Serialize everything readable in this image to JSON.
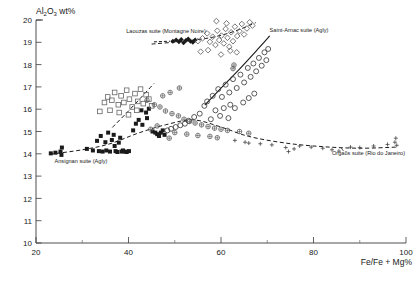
{
  "chart_data": {
    "type": "scatter",
    "title": "",
    "xlabel": "Fe/Fe + Mg%",
    "ylabel": "Al2O3 wt%",
    "ylabel_parts": {
      "pre": "Al",
      "sub1": "2",
      "mid": "O",
      "sub2": "3",
      "post": " wt%"
    },
    "xlim": [
      20,
      100
    ],
    "ylim": [
      10,
      20
    ],
    "xticks": [
      20,
      40,
      60,
      80,
      100
    ],
    "xticklabels": [
      "20",
      "40",
      "60",
      "80",
      "100"
    ],
    "xminorticks": [
      30,
      50,
      70,
      90
    ],
    "yticks": [
      10,
      11,
      12,
      13,
      14,
      15,
      16,
      17,
      18,
      19,
      20
    ],
    "yticklabels": [
      "10",
      "11",
      "12",
      "13",
      "14",
      "15",
      "16",
      "17",
      "18",
      "19",
      "20"
    ],
    "grid": false,
    "legend_position": "inline-annotations",
    "annotations": [
      {
        "name": "laouzas-label",
        "text": "Laouzas suite (Montagne Noire)",
        "x": 39.5,
        "y": 19.42,
        "anchor": "start"
      },
      {
        "name": "saint-arnac-label",
        "text": "Saint-Arnac suite (Agly)",
        "x": 70.5,
        "y": 19.45,
        "anchor": "start"
      },
      {
        "name": "ansignan-label",
        "text": "Ansignan suite (Agly)",
        "x": 24.0,
        "y": 13.6,
        "anchor": "start"
      },
      {
        "name": "orgaos-label",
        "text": "Orgaõs suite (Rio do Janeiro)",
        "x": 84.0,
        "y": 13.95,
        "anchor": "start"
      }
    ],
    "series": [
      {
        "name": "Ansignan suite (Agly)",
        "marker": "filled-square",
        "color": "#1a1a1a",
        "points": [
          [
            23.2,
            14.02
          ],
          [
            24.2,
            14.05
          ],
          [
            25.3,
            14.1
          ],
          [
            25.6,
            14.28
          ],
          [
            25.5,
            13.95
          ],
          [
            31.0,
            14.22
          ],
          [
            32.3,
            14.15
          ],
          [
            33.2,
            14.58
          ],
          [
            33.6,
            14.12
          ],
          [
            34.4,
            14.1
          ],
          [
            34.0,
            14.8
          ],
          [
            35.0,
            14.52
          ],
          [
            35.6,
            14.95
          ],
          [
            35.2,
            14.15
          ],
          [
            36.0,
            14.1
          ],
          [
            36.4,
            14.62
          ],
          [
            36.8,
            14.85
          ],
          [
            37.0,
            14.35
          ],
          [
            37.2,
            14.12
          ],
          [
            37.6,
            14.08
          ],
          [
            37.9,
            14.5
          ],
          [
            38.2,
            14.72
          ],
          [
            38.5,
            14.1
          ],
          [
            38.8,
            14.15
          ],
          [
            39.2,
            14.1
          ],
          [
            39.6,
            14.08
          ],
          [
            40.1,
            14.12
          ],
          [
            41.0,
            15.05
          ],
          [
            41.6,
            15.35
          ],
          [
            42.2,
            15.52
          ],
          [
            43.0,
            15.3
          ],
          [
            44.0,
            15.6
          ],
          [
            45.2,
            15.0
          ],
          [
            45.8,
            14.95
          ],
          [
            46.2,
            14.88
          ],
          [
            46.6,
            14.8
          ],
          [
            47.0,
            14.95
          ],
          [
            47.4,
            15.05
          ],
          [
            47.8,
            14.85
          ],
          [
            43.8,
            15.85
          ],
          [
            44.4,
            16.02
          ],
          [
            42.8,
            15.95
          ]
        ]
      },
      {
        "name": "Laouzas suite (Montagne Noire) - filled",
        "marker": "filled-diamond",
        "color": "#1a1a1a",
        "points": [
          [
            49.6,
            19.05
          ],
          [
            50.3,
            19.1
          ],
          [
            50.9,
            19.02
          ],
          [
            51.4,
            19.12
          ],
          [
            51.9,
            18.98
          ],
          [
            52.4,
            19.08
          ],
          [
            52.9,
            19.15
          ],
          [
            53.4,
            19.05
          ],
          [
            53.9,
            19.0
          ],
          [
            54.4,
            19.1
          ]
        ]
      },
      {
        "name": "Laouzas suite (Montagne Noire) - open",
        "marker": "open-diamond",
        "color": "#555555",
        "points": [
          [
            55.0,
            19.05
          ],
          [
            56.0,
            19.18
          ],
          [
            57.0,
            19.4
          ],
          [
            57.6,
            19.02
          ],
          [
            58.2,
            19.25
          ],
          [
            58.8,
            18.88
          ],
          [
            59.2,
            19.52
          ],
          [
            59.6,
            19.1
          ],
          [
            60.1,
            19.3
          ],
          [
            60.6,
            18.95
          ],
          [
            61.0,
            19.6
          ],
          [
            61.4,
            19.2
          ],
          [
            61.8,
            18.8
          ],
          [
            62.2,
            19.45
          ],
          [
            62.6,
            19.05
          ],
          [
            63.0,
            19.7
          ],
          [
            63.5,
            19.28
          ],
          [
            64.0,
            19.5
          ],
          [
            64.5,
            19.82
          ],
          [
            65.0,
            19.35
          ],
          [
            65.6,
            19.62
          ],
          [
            66.2,
            19.9
          ],
          [
            62.0,
            18.62
          ],
          [
            63.4,
            18.55
          ],
          [
            60.0,
            18.45
          ],
          [
            57.2,
            18.65
          ],
          [
            55.6,
            18.58
          ],
          [
            66.8,
            19.75
          ],
          [
            59.0,
            19.95
          ],
          [
            61.2,
            19.85
          ]
        ]
      },
      {
        "name": "Saint-Arnac suite (Agly)",
        "marker": "open-circle",
        "color": "#333333",
        "points": [
          [
            57.0,
            16.35
          ],
          [
            58.2,
            16.6
          ],
          [
            59.4,
            16.9
          ],
          [
            60.2,
            16.55
          ],
          [
            61.0,
            17.1
          ],
          [
            61.8,
            16.75
          ],
          [
            62.6,
            17.35
          ],
          [
            63.4,
            16.95
          ],
          [
            64.2,
            17.55
          ],
          [
            65.0,
            17.2
          ],
          [
            65.8,
            17.85
          ],
          [
            66.4,
            17.45
          ],
          [
            67.0,
            18.05
          ],
          [
            67.6,
            17.7
          ],
          [
            68.2,
            18.3
          ],
          [
            68.8,
            17.95
          ],
          [
            69.4,
            18.55
          ],
          [
            69.8,
            18.2
          ],
          [
            70.2,
            18.7
          ],
          [
            62.0,
            16.2
          ],
          [
            60.6,
            16.05
          ],
          [
            58.8,
            15.95
          ],
          [
            56.4,
            16.15
          ],
          [
            63.0,
            16.05
          ],
          [
            64.8,
            16.3
          ],
          [
            66.0,
            16.5
          ],
          [
            67.2,
            16.7
          ],
          [
            59.8,
            15.7
          ],
          [
            61.6,
            15.6
          ],
          [
            57.8,
            15.55
          ],
          [
            55.4,
            15.8
          ],
          [
            54.2,
            15.65
          ],
          [
            53.0,
            15.48
          ],
          [
            52.2,
            15.35
          ],
          [
            51.2,
            15.28
          ],
          [
            50.2,
            15.2
          ],
          [
            49.2,
            15.12
          ],
          [
            48.4,
            15.05
          ]
        ]
      },
      {
        "name": "Open squares cluster",
        "marker": "open-square",
        "color": "#666666",
        "points": [
          [
            35.5,
            16.55
          ],
          [
            36.4,
            16.4
          ],
          [
            37.0,
            16.75
          ],
          [
            37.8,
            16.2
          ],
          [
            38.4,
            16.6
          ],
          [
            39.0,
            16.3
          ],
          [
            39.6,
            16.85
          ],
          [
            40.2,
            16.45
          ],
          [
            40.8,
            16.1
          ],
          [
            41.4,
            16.7
          ],
          [
            42.0,
            16.35
          ],
          [
            42.6,
            16.9
          ],
          [
            43.2,
            16.25
          ],
          [
            43.8,
            16.65
          ],
          [
            34.8,
            16.3
          ],
          [
            36.0,
            15.95
          ],
          [
            38.0,
            15.85
          ],
          [
            40.0,
            15.75
          ],
          [
            41.8,
            15.95
          ],
          [
            44.4,
            16.45
          ],
          [
            45.0,
            16.15
          ],
          [
            33.8,
            15.9
          ]
        ]
      },
      {
        "name": "Crossed circles",
        "marker": "crossed-circle",
        "color": "#555555",
        "points": [
          [
            44.0,
            16.4
          ],
          [
            45.6,
            16.2
          ],
          [
            46.8,
            16.1
          ],
          [
            48.0,
            15.92
          ],
          [
            49.4,
            15.8
          ],
          [
            50.8,
            15.7
          ],
          [
            52.0,
            15.55
          ],
          [
            53.2,
            15.45
          ],
          [
            54.4,
            15.38
          ],
          [
            55.8,
            15.3
          ],
          [
            57.2,
            15.22
          ],
          [
            58.6,
            15.15
          ],
          [
            60.0,
            15.1
          ],
          [
            61.4,
            15.05
          ],
          [
            50.0,
            14.95
          ],
          [
            52.6,
            14.88
          ],
          [
            55.0,
            14.82
          ],
          [
            57.6,
            14.78
          ],
          [
            47.4,
            16.6
          ],
          [
            49.0,
            16.75
          ],
          [
            51.0,
            16.95
          ],
          [
            62.8,
            17.98
          ],
          [
            62.6,
            17.82
          ],
          [
            64.0,
            15.0
          ],
          [
            66.0,
            14.92
          ],
          [
            46.2,
            15.25
          ],
          [
            44.8,
            15.1
          ],
          [
            48.8,
            14.7
          ],
          [
            59.2,
            14.72
          ]
        ]
      },
      {
        "name": "Orgaõs suite (Rio do Janeiro)",
        "marker": "plus",
        "color": "#444444",
        "points": [
          [
            63.0,
            14.6
          ],
          [
            65.2,
            14.52
          ],
          [
            66.0,
            14.48
          ],
          [
            68.5,
            14.45
          ],
          [
            71.0,
            14.4
          ],
          [
            74.0,
            14.28
          ],
          [
            74.6,
            14.1
          ],
          [
            75.8,
            14.22
          ],
          [
            77.0,
            14.35
          ],
          [
            79.5,
            14.3
          ],
          [
            82.0,
            14.25
          ],
          [
            84.0,
            14.18
          ],
          [
            85.5,
            14.12
          ],
          [
            88.0,
            14.3
          ],
          [
            90.0,
            14.28
          ],
          [
            93.0,
            14.35
          ],
          [
            96.0,
            14.42
          ],
          [
            97.6,
            14.52
          ],
          [
            97.8,
            14.7
          ],
          [
            98.0,
            14.38
          ]
        ]
      }
    ],
    "trend_lines": [
      {
        "name": "laouzas-trend",
        "style": "dashed",
        "points": [
          [
            45.0,
            18.92
          ],
          [
            52.0,
            19.05
          ],
          [
            58.0,
            19.22
          ],
          [
            63.0,
            19.5
          ],
          [
            67.5,
            19.88
          ]
        ]
      },
      {
        "name": "saint-arnac-trend",
        "style": "solid",
        "points": [
          [
            56.5,
            16.18
          ],
          [
            60.0,
            16.95
          ],
          [
            64.0,
            17.8
          ],
          [
            68.0,
            18.7
          ],
          [
            70.5,
            19.28
          ]
        ]
      },
      {
        "name": "ansignan-orgaos-trend",
        "style": "dashed",
        "points": [
          [
            23.0,
            13.98
          ],
          [
            30.0,
            14.18
          ],
          [
            36.0,
            14.45
          ],
          [
            42.0,
            14.92
          ],
          [
            48.0,
            15.3
          ],
          [
            54.0,
            15.52
          ],
          [
            60.0,
            15.2
          ],
          [
            66.0,
            14.78
          ],
          [
            74.0,
            14.48
          ],
          [
            82.0,
            14.32
          ],
          [
            90.0,
            14.25
          ],
          [
            98.0,
            14.3
          ]
        ]
      },
      {
        "name": "open-square-trend",
        "style": "dashed",
        "points": [
          [
            36.5,
            15.18
          ],
          [
            40.0,
            15.92
          ],
          [
            43.5,
            16.7
          ],
          [
            45.5,
            17.15
          ]
        ]
      },
      {
        "name": "laouzas-leader",
        "style": "dashed-leader",
        "points": [
          [
            45.5,
            19.02
          ],
          [
            49.0,
            19.05
          ]
        ]
      }
    ]
  }
}
